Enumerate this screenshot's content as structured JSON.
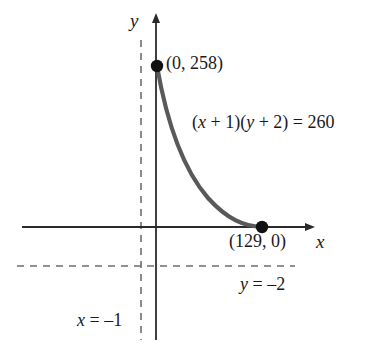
{
  "figure": {
    "background_color": "#ffffff",
    "axis_color": "#2b2b2b",
    "curve_color": "#58595b",
    "dashed_color": "#6d6e71",
    "text_color": "#1a1a1a"
  },
  "axes": {
    "y_axis_label": "y",
    "x_axis_label": "x",
    "x_axis_has_arrow": true,
    "y_axis_has_arrow": true
  },
  "labels": {
    "point_y_intercept": "(0, 258)",
    "point_x_intercept": "(129, 0)",
    "equation": "(x + 1)(y + 2) = 260",
    "asymptote_horizontal": "y = –2",
    "asymptote_vertical": "x = –1"
  },
  "chart_data": {
    "type": "line",
    "title": "(x + 1)(y + 2) = 260",
    "xlabel": "x",
    "ylabel": "y",
    "equation": "(x + 1)(y + 2) = 260",
    "grid": false,
    "legend": "none",
    "asymptotes": [
      {
        "name": "x = –1",
        "type": "vertical",
        "value": -1,
        "style": "dashed"
      },
      {
        "name": "y = –2",
        "type": "horizontal",
        "value": -2,
        "style": "dashed"
      }
    ],
    "annotations": [
      {
        "text": "(0, 258)",
        "x": 0,
        "y": 258
      },
      {
        "text": "(129, 0)",
        "x": 129,
        "y": 0
      },
      {
        "text": "(x + 1)(y + 2) = 260",
        "x": 40,
        "y": 160
      },
      {
        "text": "y = –2",
        "x": 95,
        "y": -20
      },
      {
        "text": "x = –1",
        "x": -60,
        "y": -80
      }
    ],
    "points": [
      {
        "label": "(0, 258)",
        "x": 0,
        "y": 258,
        "marker": "filled-circle"
      },
      {
        "label": "(129, 0)",
        "x": 129,
        "y": 0,
        "marker": "filled-circle"
      }
    ],
    "series": [
      {
        "name": "(x + 1)(y + 2) = 260",
        "x": [
          0,
          5,
          10,
          20,
          30,
          45,
          60,
          80,
          100,
          129
        ],
        "y": [
          258,
          41.33,
          21.64,
          10.38,
          6.39,
          3.65,
          2.26,
          1.21,
          0.574,
          0
        ]
      }
    ],
    "xlim": [
      -30,
      160
    ],
    "ylim": [
      -40,
      300
    ]
  }
}
